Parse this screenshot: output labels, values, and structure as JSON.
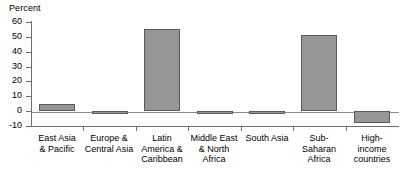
{
  "chart_data": {
    "type": "bar",
    "title": "",
    "subtitle": "",
    "xlabel": "",
    "ylabel": "Percent",
    "ylim": [
      -10,
      60
    ],
    "yticks": [
      -10,
      0,
      10,
      20,
      30,
      40,
      50,
      60
    ],
    "ytick_labels": [
      "-10",
      "0",
      "10",
      "20",
      "30",
      "40",
      "50",
      "60"
    ],
    "grid": false,
    "legend": null,
    "bar_color": "#969696",
    "bar_edge_color": "#5a5a5a",
    "axis_color": "#6e6e6e",
    "categories": [
      "East Asia\n& Pacific",
      "Europe &\nCentral Asia",
      "Latin\nAmerica &\nCaribbean",
      "Middle East\n& North\nAfrica",
      "South Asia",
      "Sub-\nSaharan\nAfrica",
      "High-\nincome\ncountries"
    ],
    "values": [
      5,
      -2,
      55,
      -1.5,
      -1.5,
      51,
      -8
    ]
  }
}
